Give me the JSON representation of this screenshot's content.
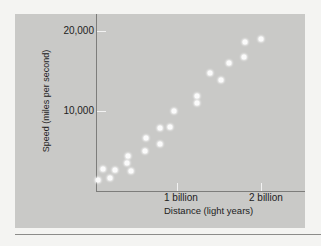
{
  "chart_data": {
    "type": "scatter",
    "title": "",
    "xlabel": "Distance (light years)",
    "ylabel": "Speed (miles per second)",
    "x_ticks": [
      {
        "value": 1,
        "label": "1 billion"
      },
      {
        "value": 2,
        "label": "2 billion"
      }
    ],
    "y_ticks": [
      {
        "value": 10000,
        "label": "10,000"
      },
      {
        "value": 20000,
        "label": "20,000"
      }
    ],
    "xlim": [
      0,
      2.5
    ],
    "ylim": [
      0,
      22000
    ],
    "x_unit": "billion light years",
    "grid": false,
    "legend": null,
    "points": [
      {
        "x": 0.02,
        "y": 1375
      },
      {
        "x": 0.17,
        "y": 1625
      },
      {
        "x": 0.09,
        "y": 2800
      },
      {
        "x": 0.23,
        "y": 2600
      },
      {
        "x": 0.39,
        "y": 4375
      },
      {
        "x": 0.38,
        "y": 3500
      },
      {
        "x": 0.43,
        "y": 2500
      },
      {
        "x": 0.6,
        "y": 6600
      },
      {
        "x": 0.59,
        "y": 5000
      },
      {
        "x": 0.78,
        "y": 7900
      },
      {
        "x": 0.78,
        "y": 5900
      },
      {
        "x": 0.9,
        "y": 8000
      },
      {
        "x": 0.95,
        "y": 10000
      },
      {
        "x": 1.22,
        "y": 11900
      },
      {
        "x": 1.22,
        "y": 11000
      },
      {
        "x": 1.38,
        "y": 14750
      },
      {
        "x": 1.52,
        "y": 13900
      },
      {
        "x": 1.61,
        "y": 16000
      },
      {
        "x": 1.8,
        "y": 18600
      },
      {
        "x": 1.79,
        "y": 16750
      },
      {
        "x": 2.0,
        "y": 19000
      }
    ],
    "colors": {
      "panel": "#c9c9c7",
      "points": "#fbfbfb",
      "axes": "#7d7d7b"
    }
  }
}
